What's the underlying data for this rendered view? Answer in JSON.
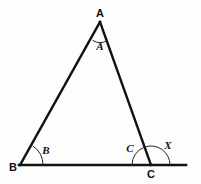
{
  "figure": {
    "background_color": "#fdfdfd",
    "ink_color": "#111111",
    "width": 201,
    "height": 184
  },
  "vertices": {
    "a": {
      "label": "A",
      "x": 100,
      "y": 22,
      "label_x": 100,
      "label_y": 17
    },
    "b": {
      "label": "B",
      "x": 20,
      "y": 165,
      "label_x": 13,
      "label_y": 171
    },
    "c": {
      "label": "C",
      "x": 151,
      "y": 165,
      "label_x": 151,
      "label_y": 178
    }
  },
  "segments": [
    {
      "name": "side-ab",
      "x1": 100,
      "y1": 22,
      "x2": 20,
      "y2": 165,
      "width": 2.4
    },
    {
      "name": "side-ac",
      "x1": 100,
      "y1": 22,
      "x2": 151,
      "y2": 165,
      "width": 2.4
    },
    {
      "name": "base-line-bx",
      "x1": 19,
      "y1": 165,
      "x2": 186,
      "y2": 165,
      "width": 2.6
    }
  ],
  "angles": [
    {
      "name": "angle-a",
      "label": "A",
      "vertex": "a",
      "label_x": 100,
      "label_y": 49,
      "arc_path": "M 92.6 40.2 A 13 13 0 0 0 107.4 40.2"
    },
    {
      "name": "angle-b",
      "label": "B",
      "vertex": "b",
      "label_x": 46,
      "label_y": 154,
      "arc_path": "M 43 165 A 23 23 0 0 0 32.9 146.0"
    },
    {
      "name": "angle-c-interior",
      "label": "C",
      "vertex": "c",
      "label_x": 130,
      "label_y": 152,
      "arc_path": "M 132 165 A 19 19 0 0 1 144.3 147.2"
    },
    {
      "name": "angle-x-exterior",
      "label": "X",
      "vertex": "c",
      "label_x": 168,
      "label_y": 149,
      "arc_path": "M 144.3 147.2 A 19 19 0 0 1 170 165"
    }
  ],
  "caption": ""
}
